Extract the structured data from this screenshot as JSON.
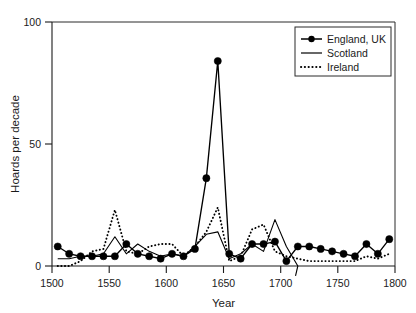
{
  "chart_data": {
    "type": "line",
    "title": "",
    "xlabel": "Year",
    "ylabel": "Hoards per decade",
    "xlim": [
      1500,
      1800
    ],
    "ylim": [
      0,
      100
    ],
    "xticks": [
      1500,
      1550,
      1600,
      1650,
      1700,
      1750,
      1800
    ],
    "yticks": [
      0,
      50,
      100
    ],
    "grid": false,
    "legend_position": "top-right",
    "x": [
      1505,
      1515,
      1525,
      1535,
      1545,
      1555,
      1565,
      1575,
      1585,
      1595,
      1605,
      1615,
      1625,
      1635,
      1645,
      1655,
      1665,
      1675,
      1685,
      1695,
      1705,
      1715,
      1725,
      1735,
      1745,
      1755,
      1765,
      1775,
      1785,
      1795
    ],
    "series": [
      {
        "name": "England, UK",
        "marker": "filled-circle",
        "style": "solid-with-markers",
        "values": [
          8,
          5,
          4,
          4,
          4,
          4,
          9,
          5,
          4,
          3,
          5,
          4,
          7,
          36,
          84,
          5,
          3,
          9,
          9,
          10,
          2,
          8,
          8,
          7,
          6,
          5,
          4,
          9,
          5,
          11
        ]
      },
      {
        "name": "Scotland",
        "marker": "none",
        "style": "solid",
        "values": [
          3,
          3,
          4,
          4,
          5,
          12,
          5,
          9,
          6,
          4,
          5,
          4,
          8,
          13,
          14,
          3,
          5,
          9,
          6,
          19,
          8,
          0,
          0,
          0,
          0,
          0,
          0,
          0,
          0,
          0
        ]
      },
      {
        "name": "Ireland",
        "marker": "none",
        "style": "dotted",
        "values": [
          0,
          0,
          2,
          6,
          7,
          23,
          6,
          5,
          8,
          9,
          9,
          4,
          8,
          14,
          24,
          2,
          4,
          15,
          17,
          6,
          4,
          3,
          2,
          2,
          2,
          2,
          2,
          4,
          3,
          5
        ]
      }
    ]
  },
  "legend": {
    "entries": [
      {
        "label": "England, UK",
        "sample": "line-with-marker"
      },
      {
        "label": "Scotland",
        "sample": "solid-line"
      },
      {
        "label": "Ireland",
        "sample": "dotted-line"
      }
    ]
  },
  "colors": {
    "series": "#000000",
    "axis": "#1a1a1a",
    "background": "#ffffff"
  }
}
